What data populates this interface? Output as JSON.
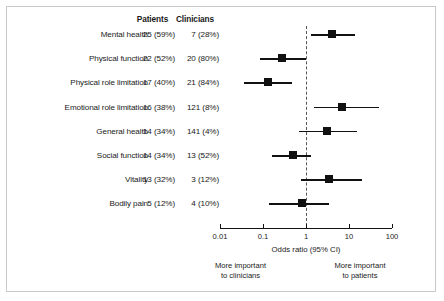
{
  "chart_data": {
    "type": "forest",
    "title": "",
    "xlabel": "Odds ratio (95% CI)",
    "ylabel": "",
    "xscale": "log",
    "xlim": [
      0.01,
      100
    ],
    "xticks": [
      "0.01",
      "0.1",
      "1",
      "10",
      "100"
    ],
    "xtick_values": [
      0.01,
      0.1,
      1,
      10,
      100
    ],
    "reference_line": 1,
    "grid": false,
    "legend": "none",
    "columns": [
      "",
      "Patients",
      "Clinicians"
    ],
    "rows": [
      {
        "label": "Mental health",
        "patients": "25 (59%)",
        "clinicians": "7 (28%)",
        "odds_ratio": 4.0,
        "ci_low": 1.3,
        "ci_high": 14.0
      },
      {
        "label": "Physical function",
        "patients": "22 (52%)",
        "clinicians": "20 (80%)",
        "odds_ratio": 0.27,
        "ci_low": 0.085,
        "ci_high": 1.0
      },
      {
        "label": "Physical role limitation",
        "patients": "17 (40%)",
        "clinicians": "21 (84%)",
        "odds_ratio": 0.13,
        "ci_low": 0.037,
        "ci_high": 0.48
      },
      {
        "label": "Emotional role limitation",
        "patients": "16 (38%)",
        "clinicians": "121 (8%)",
        "odds_ratio": 7.0,
        "ci_low": 1.5,
        "ci_high": 50.0
      },
      {
        "label": "General health",
        "patients": "14 (34%)",
        "clinicians": "141 (4%)",
        "odds_ratio": 3.0,
        "ci_low": 0.7,
        "ci_high": 15.0
      },
      {
        "label": "Social function",
        "patients": "14 (34%)",
        "clinicians": "13 (52%)",
        "odds_ratio": 0.5,
        "ci_low": 0.16,
        "ci_high": 1.3
      },
      {
        "label": "Vitality",
        "patients": "13 (32%)",
        "clinicians": "3 (12%)",
        "odds_ratio": 3.5,
        "ci_low": 0.75,
        "ci_high": 20.0
      },
      {
        "label": "Bodily pain",
        "patients": "5 (12%)",
        "clinicians": "4 (10%)",
        "odds_ratio": 0.8,
        "ci_low": 0.14,
        "ci_high": 3.4
      }
    ],
    "annotations": {
      "left": "More important\nto clinicians",
      "left_line1": "More important",
      "left_line2": "to clinicians",
      "right": "More important\nto patients",
      "right_line1": "More important",
      "right_line2": "to patients"
    }
  },
  "colors": {
    "marker": "#111111",
    "line": "#111111",
    "reference": "#555555",
    "frame": "#c9c9c9",
    "text": "#1a1a1a"
  }
}
